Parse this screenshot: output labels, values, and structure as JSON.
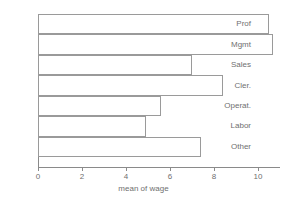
{
  "chart_data": {
    "type": "bar",
    "orientation": "horizontal",
    "title": "",
    "xlabel": "mean of wage",
    "ylabel": "",
    "categories": [
      "Prof",
      "Mgmt",
      "Sales",
      "Cler.",
      "Operat.",
      "Labor",
      "Other"
    ],
    "values": [
      10.5,
      10.7,
      7.0,
      8.4,
      5.6,
      4.9,
      7.4
    ],
    "xlim": [
      0,
      11
    ],
    "xticks": [
      0,
      2,
      4,
      6,
      8,
      10
    ],
    "xtick_labels": [
      "0",
      "2",
      "4",
      "6",
      "8",
      "10"
    ],
    "grid": false,
    "legend": false,
    "bar_fill_color": "#ffffff",
    "bar_border_color": "#9a9a9a",
    "axis_color": "#8a8a8a",
    "text_color": "#6f6f6f",
    "background_color": "#ffffff"
  }
}
